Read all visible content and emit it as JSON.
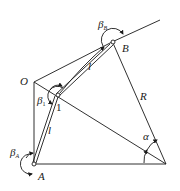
{
  "diagram": {
    "title": "",
    "points": {
      "O": {
        "label": "O"
      },
      "A": {
        "label": "A"
      },
      "B": {
        "label": "B"
      },
      "joint1": {
        "label": "1"
      }
    },
    "segments": {
      "link_A1": {
        "label": "l"
      },
      "link_1B": {
        "label": "l"
      },
      "radius": {
        "label": "R"
      }
    },
    "angles": {
      "beta_A": {
        "symbol": "β",
        "subscript": "A"
      },
      "beta_1": {
        "symbol": "β",
        "subscript": "1"
      },
      "beta_B": {
        "symbol": "β",
        "subscript": "B"
      },
      "alpha": {
        "symbol": "α"
      }
    }
  }
}
